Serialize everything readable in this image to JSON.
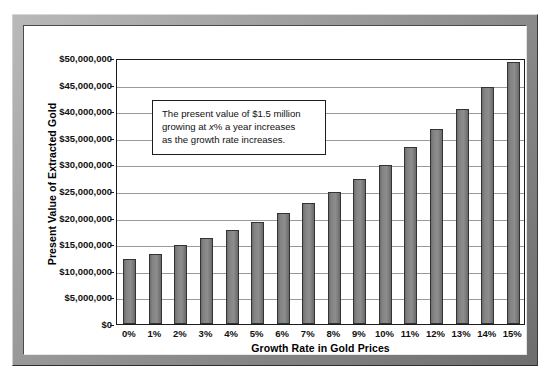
{
  "chart_data": {
    "type": "bar",
    "title": "",
    "subtitle": "",
    "xlabel": "Growth Rate in Gold Prices",
    "ylabel": "Present Value of Extracted Gold",
    "categories": [
      "0%",
      "1%",
      "2%",
      "3%",
      "4%",
      "5%",
      "6%",
      "7%",
      "8%",
      "9%",
      "10%",
      "11%",
      "12%",
      "13%",
      "14%",
      "15%"
    ],
    "values": [
      12300000,
      13200000,
      14900000,
      16100000,
      17600000,
      19200000,
      20900000,
      22800000,
      24900000,
      27300000,
      29900000,
      33300000,
      36700000,
      40500000,
      44600000,
      49200000
    ],
    "value_labels": [
      "$12,300,000",
      "$13,200,000",
      "$14,900,000",
      "$16,100,000",
      "$17,600,000",
      "$19,200,000",
      "$20,900,000",
      "$22,800,000",
      "$24,900,000",
      "$27,300,000",
      "$29,900,000",
      "$33,300,000",
      "$36,700,000",
      "$40,500,000",
      "$44,600,000",
      "$49,200,000"
    ],
    "ylim": [
      0,
      50000000
    ],
    "yticks": [
      0,
      5000000,
      10000000,
      15000000,
      20000000,
      25000000,
      30000000,
      35000000,
      40000000,
      45000000,
      50000000
    ],
    "ytick_labels": [
      "$0",
      "$5,000,000",
      "$10,000,000",
      "$15,000,000",
      "$20,000,000",
      "$25,000,000",
      "$30,000,000",
      "$35,000,000",
      "$40,000,000",
      "$45,000,000",
      "$50,000,000"
    ],
    "grid": true,
    "legend": false,
    "legend_position": "none",
    "bar_color": "#838383",
    "bar_edge_color": "#333333",
    "plot_background": "#ffffff",
    "gridline_color": "#9a9a9a",
    "axis_color": "#1c1c1c"
  },
  "annotation": {
    "line1_before": "The present value of $1.5 million",
    "line2_before": "growing at ",
    "line2_italic": "x",
    "line2_after": "% a year increases",
    "line3": "as the growth rate increases."
  },
  "frame": {
    "border_color": "#8a8a8a",
    "inner_background": "#ffffff"
  }
}
